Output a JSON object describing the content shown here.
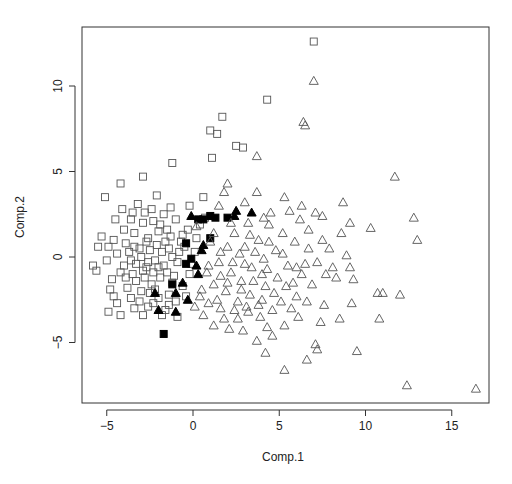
{
  "chart_data": {
    "type": "scatter",
    "title": "",
    "xlabel": "Comp.1",
    "ylabel": "Comp.2",
    "xlim": [
      -6.5,
      17.2
    ],
    "ylim": [
      -8.6,
      13.3
    ],
    "xticks": [
      -5,
      0,
      5,
      10,
      15
    ],
    "yticks": [
      -5,
      0,
      5,
      10
    ],
    "grid": false,
    "legend": null,
    "series": [
      {
        "name": "group-open-square",
        "marker": "open-square",
        "color": "#555555",
        "points": [
          [
            7.0,
            12.6
          ],
          [
            4.3,
            9.2
          ],
          [
            1.7,
            8.2
          ],
          [
            1.0,
            7.4
          ],
          [
            1.4,
            7.2
          ],
          [
            2.5,
            6.5
          ],
          [
            2.9,
            6.4
          ],
          [
            1.1,
            5.8
          ],
          [
            -1.2,
            5.5
          ],
          [
            -2.9,
            4.7
          ],
          [
            -4.2,
            4.3
          ],
          [
            -5.1,
            3.5
          ],
          [
            0.6,
            3.5
          ],
          [
            -0.2,
            3.0
          ],
          [
            -1.3,
            2.9
          ],
          [
            -2.8,
            2.6
          ],
          [
            -3.6,
            2.2
          ],
          [
            -2.3,
            2.1
          ],
          [
            -4.5,
            2.2
          ],
          [
            -5.3,
            1.2
          ],
          [
            -5.5,
            0.6
          ],
          [
            -4.9,
            0.6
          ],
          [
            -5.8,
            -0.5
          ],
          [
            -5.6,
            -0.8
          ],
          [
            -4.8,
            -1.9
          ],
          [
            -4.6,
            -2.3
          ],
          [
            -4.9,
            -3.2
          ],
          [
            -4.2,
            -3.4
          ],
          [
            -3.4,
            -3.0
          ],
          [
            -2.6,
            -2.9
          ],
          [
            -1.6,
            -3.1
          ],
          [
            -1.0,
            -2.6
          ],
          [
            -1.4,
            -2.2
          ],
          [
            -0.6,
            -1.7
          ],
          [
            -0.2,
            -1.0
          ],
          [
            0.1,
            0.3
          ],
          [
            -0.7,
            0.9
          ],
          [
            -1.3,
            1.2
          ],
          [
            -2.0,
            1.5
          ],
          [
            -2.6,
            1.1
          ],
          [
            -3.1,
            0.5
          ],
          [
            -3.6,
            -0.2
          ],
          [
            -3.9,
            0.8
          ],
          [
            -4.2,
            -0.9
          ],
          [
            -3.3,
            -1.4
          ],
          [
            -2.7,
            -0.6
          ],
          [
            -2.2,
            -0.2
          ],
          [
            -1.8,
            0.3
          ],
          [
            -1.5,
            -0.9
          ],
          [
            -2.4,
            -1.6
          ],
          [
            -3.0,
            -2.0
          ],
          [
            -3.8,
            -1.8
          ],
          [
            -2.0,
            -2.4
          ],
          [
            -1.2,
            -1.5
          ],
          [
            -0.9,
            -0.3
          ],
          [
            -0.5,
            0.6
          ],
          [
            -1.9,
            1.9
          ],
          [
            -2.9,
            2.0
          ],
          [
            -3.4,
            1.4
          ],
          [
            -4.0,
            1.6
          ],
          [
            -4.4,
            0.2
          ],
          [
            -4.0,
            -0.5
          ],
          [
            -3.5,
            -1.0
          ],
          [
            -2.8,
            -1.2
          ],
          [
            -2.3,
            -0.9
          ],
          [
            -1.7,
            -0.5
          ],
          [
            -1.2,
            0.0
          ],
          [
            -2.5,
            0.4
          ],
          [
            -3.0,
            0.0
          ],
          [
            -3.3,
            -0.4
          ],
          [
            -2.6,
            -0.3
          ],
          [
            -2.1,
            0.7
          ],
          [
            -1.6,
            0.9
          ],
          [
            -2.9,
            -0.8
          ],
          [
            -3.7,
            0.3
          ],
          [
            -2.2,
            -1.9
          ],
          [
            -1.4,
            -2.8
          ],
          [
            -0.4,
            -2.3
          ],
          [
            -0.1,
            -0.4
          ],
          [
            0.4,
            1.9
          ],
          [
            -0.3,
            1.6
          ],
          [
            -1.0,
            2.2
          ],
          [
            -1.7,
            2.5
          ],
          [
            -3.2,
            3.1
          ],
          [
            -2.1,
            3.6
          ],
          [
            0.7,
            2.3
          ],
          [
            -4.7,
            -1.3
          ],
          [
            -4.4,
            -2.7
          ],
          [
            -3.1,
            -2.6
          ],
          [
            -2.5,
            -2.1
          ],
          [
            -1.9,
            -1.2
          ],
          [
            -1.1,
            -1.1
          ],
          [
            -0.8,
            0.3
          ],
          [
            -1.4,
            0.5
          ],
          [
            -2.0,
            -0.6
          ],
          [
            -2.7,
            0.9
          ],
          [
            -3.4,
            0.6
          ],
          [
            -3.9,
            -1.2
          ],
          [
            -3.6,
            -2.4
          ],
          [
            -2.9,
            -3.4
          ],
          [
            -2.3,
            -2.7
          ],
          [
            -1.8,
            -3.4
          ],
          [
            -0.9,
            -3.5
          ],
          [
            -3.5,
            2.6
          ],
          [
            -4.6,
            1.0
          ],
          [
            -5.0,
            -0.2
          ],
          [
            -4.1,
            2.8
          ],
          [
            0.2,
            1.1
          ],
          [
            -0.6,
            1.3
          ],
          [
            -2.4,
            2.8
          ],
          [
            -1.5,
            1.6
          ]
        ]
      },
      {
        "name": "group-filled-square",
        "marker": "filled-square",
        "color": "#000000",
        "points": [
          [
            0.3,
            2.2
          ],
          [
            1.0,
            2.4
          ],
          [
            1.3,
            2.3
          ],
          [
            2.0,
            2.3
          ],
          [
            1.0,
            1.1
          ],
          [
            -0.1,
            -0.1
          ],
          [
            -0.4,
            -0.4
          ],
          [
            -1.2,
            -1.6
          ],
          [
            -1.7,
            -4.5
          ],
          [
            -0.4,
            0.8
          ],
          [
            0.6,
            2.2
          ]
        ]
      },
      {
        "name": "group-filled-triangle",
        "marker": "filled-triangle",
        "color": "#000000",
        "points": [
          [
            -0.1,
            2.4
          ],
          [
            2.5,
            2.7
          ],
          [
            3.4,
            2.6
          ],
          [
            0.6,
            0.7
          ],
          [
            0.5,
            0.4
          ],
          [
            0.2,
            -0.5
          ],
          [
            0.3,
            -1.0
          ],
          [
            -0.6,
            -1.5
          ],
          [
            -1.0,
            -2.1
          ],
          [
            -2.2,
            -2.1
          ],
          [
            -1.0,
            -3.2
          ],
          [
            -2.0,
            -3.1
          ],
          [
            2.4,
            2.4
          ],
          [
            -0.3,
            -2.5
          ]
        ]
      },
      {
        "name": "group-open-triangle",
        "marker": "open-triangle",
        "color": "#555555",
        "points": [
          [
            7.0,
            10.3
          ],
          [
            6.4,
            7.9
          ],
          [
            6.5,
            7.7
          ],
          [
            3.7,
            5.9
          ],
          [
            11.7,
            4.7
          ],
          [
            3.7,
            3.8
          ],
          [
            5.3,
            3.5
          ],
          [
            7.1,
            2.6
          ],
          [
            8.7,
            3.2
          ],
          [
            12.8,
            2.3
          ],
          [
            13.0,
            1.0
          ],
          [
            10.3,
            1.7
          ],
          [
            8.6,
            1.4
          ],
          [
            9.1,
            2.0
          ],
          [
            7.5,
            2.4
          ],
          [
            6.7,
            1.6
          ],
          [
            6.2,
            2.2
          ],
          [
            5.2,
            1.4
          ],
          [
            4.4,
            1.9
          ],
          [
            3.8,
            1.0
          ],
          [
            3.0,
            0.6
          ],
          [
            2.4,
            1.4
          ],
          [
            1.6,
            0.3
          ],
          [
            0.9,
            -0.5
          ],
          [
            1.5,
            -0.3
          ],
          [
            2.2,
            -0.9
          ],
          [
            2.8,
            -1.4
          ],
          [
            3.4,
            -0.6
          ],
          [
            4.1,
            -0.1
          ],
          [
            4.8,
            0.4
          ],
          [
            5.5,
            -0.5
          ],
          [
            6.3,
            -1.0
          ],
          [
            7.2,
            -0.3
          ],
          [
            7.9,
            0.5
          ],
          [
            8.9,
            0.1
          ],
          [
            9.1,
            -0.6
          ],
          [
            8.3,
            -1.2
          ],
          [
            6.9,
            -1.6
          ],
          [
            6.0,
            -2.3
          ],
          [
            5.4,
            -1.7
          ],
          [
            4.7,
            -2.1
          ],
          [
            4.0,
            -2.5
          ],
          [
            3.3,
            -2.2
          ],
          [
            2.6,
            -2.6
          ],
          [
            1.9,
            -2.0
          ],
          [
            1.2,
            -1.6
          ],
          [
            0.5,
            -1.9
          ],
          [
            0.1,
            -2.9
          ],
          [
            0.6,
            -3.4
          ],
          [
            1.6,
            -3.0
          ],
          [
            2.6,
            -3.6
          ],
          [
            3.2,
            -3.2
          ],
          [
            3.9,
            -3.5
          ],
          [
            4.3,
            -4.1
          ],
          [
            4.6,
            -4.6
          ],
          [
            3.7,
            -4.9
          ],
          [
            5.3,
            -4.0
          ],
          [
            6.1,
            -3.5
          ],
          [
            7.4,
            -3.8
          ],
          [
            7.6,
            -2.8
          ],
          [
            8.5,
            -3.6
          ],
          [
            10.8,
            -3.6
          ],
          [
            10.7,
            -2.1
          ],
          [
            11.0,
            -2.1
          ],
          [
            12.0,
            -2.2
          ],
          [
            9.2,
            -2.7
          ],
          [
            7.1,
            -5.1
          ],
          [
            7.2,
            -5.4
          ],
          [
            6.6,
            -6.0
          ],
          [
            5.3,
            -6.6
          ],
          [
            9.5,
            -5.5
          ],
          [
            12.4,
            -7.5
          ],
          [
            16.4,
            -7.7
          ],
          [
            4.2,
            -5.6
          ],
          [
            2.1,
            -4.2
          ],
          [
            1.2,
            -4.0
          ],
          [
            2.9,
            -4.3
          ],
          [
            1.6,
            -1.1
          ],
          [
            2.3,
            -0.3
          ],
          [
            2.8,
            -1.9
          ],
          [
            3.5,
            -1.4
          ],
          [
            4.2,
            -1.7
          ],
          [
            4.9,
            -1.2
          ],
          [
            5.8,
            -1.5
          ],
          [
            6.5,
            -0.4
          ],
          [
            7.7,
            -1.0
          ],
          [
            5.9,
            0.9
          ],
          [
            4.5,
            2.6
          ],
          [
            3.2,
            2.0
          ],
          [
            2.0,
            0.6
          ],
          [
            1.2,
            1.4
          ],
          [
            0.8,
            -0.9
          ],
          [
            1.4,
            -2.5
          ],
          [
            2.0,
            -1.5
          ],
          [
            3.0,
            -0.4
          ],
          [
            3.6,
            0.3
          ],
          [
            4.4,
            0.9
          ],
          [
            5.2,
            0.2
          ],
          [
            6.0,
            -0.6
          ],
          [
            6.7,
            0.5
          ],
          [
            7.5,
            1.0
          ],
          [
            8.1,
            -0.6
          ],
          [
            3.8,
            -2.8
          ],
          [
            4.6,
            -3.1
          ],
          [
            5.1,
            -2.6
          ],
          [
            5.7,
            -3.0
          ],
          [
            6.6,
            -2.6
          ],
          [
            2.4,
            -3.1
          ],
          [
            1.8,
            -3.6
          ],
          [
            3.1,
            -2.9
          ],
          [
            1.5,
            3.0
          ],
          [
            2.0,
            4.3
          ],
          [
            3.0,
            3.2
          ],
          [
            4.1,
            2.3
          ],
          [
            5.6,
            2.7
          ],
          [
            0.4,
            -2.3
          ],
          [
            0.9,
            -2.7
          ],
          [
            2.2,
            2.0
          ],
          [
            3.3,
            1.3
          ],
          [
            1.0,
            0.9
          ],
          [
            4.0,
            -1.0
          ],
          [
            4.3,
            -0.7
          ],
          [
            2.7,
            0.2
          ],
          [
            9.3,
            -1.3
          ],
          [
            1.8,
            3.8
          ],
          [
            6.3,
            3.0
          ],
          [
            0.2,
            1.8
          ]
        ]
      }
    ]
  },
  "axes": {
    "x_tick_labels": [
      "−5",
      "0",
      "5",
      "10",
      "15"
    ],
    "y_tick_labels": [
      "−5",
      "0",
      "5",
      "10"
    ],
    "xlabel": "Comp.1",
    "ylabel": "Comp.2"
  }
}
